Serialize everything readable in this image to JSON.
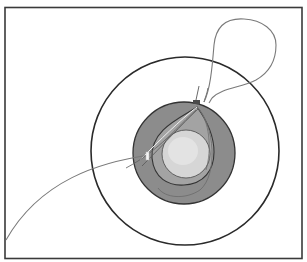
{
  "figure": {
    "type": "surgical-illustration",
    "colors": {
      "background": "#ffffff",
      "frame": "#3a3a3a",
      "outer_circle_stroke": "#2a2a2a",
      "dark_ring": "#8c8c8c",
      "iris": "#a9a9a9",
      "pupil": "#d6d6d6",
      "pupil_highlight": "#e8e8e8",
      "suture": "#7a7a7a",
      "knot": "#4a4a4a"
    },
    "labels": []
  }
}
